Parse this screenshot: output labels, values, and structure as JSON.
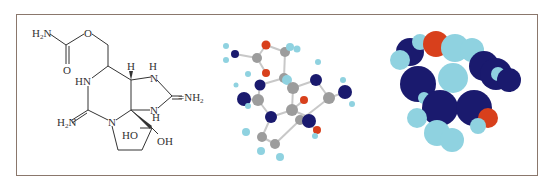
{
  "figure": {
    "panels": [
      {
        "name": "structural-formula",
        "type": "skeletal"
      },
      {
        "name": "ball-and-stick-model",
        "type": "ball-and-stick"
      },
      {
        "name": "space-filling-model",
        "type": "space-filling"
      }
    ],
    "colors": {
      "border": "#8a776c",
      "bond": "#333333",
      "carbon": "#9c9c9c",
      "nitrogen": "#1a1a6e",
      "oxygen": "#d8401c",
      "hydrogen": "#8fd2e0"
    },
    "labels": {
      "h2n_top": "H",
      "h2n_top_sub": "2",
      "h2n_top_n": "N",
      "o_ether": "O",
      "o_carbonyl": "O",
      "hn": "HN",
      "h_wedge": "H",
      "h_top_nh": "H",
      "n_top": "N",
      "eq_nh2": "=NH",
      "eq_nh2_sub": "2",
      "h2n_low": "H",
      "h2n_low_sub": "2",
      "h2n_low_n": "N",
      "n_ring": "N",
      "n_low": "N",
      "h_low": "H",
      "ho": "HO",
      "oh": "OH"
    }
  }
}
